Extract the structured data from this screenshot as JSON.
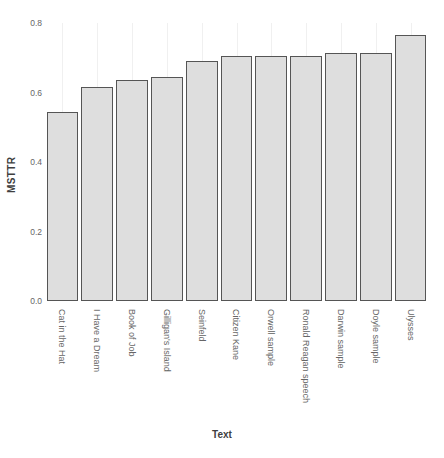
{
  "chart_data": {
    "type": "bar",
    "title": "",
    "xlabel": "Text",
    "ylabel": "MSTTR",
    "ylim": [
      0.0,
      0.8
    ],
    "yticks": [
      "0.0",
      "0.2",
      "0.4",
      "0.6",
      "0.8"
    ],
    "ytick_values": [
      0.0,
      0.2,
      0.4,
      0.6,
      0.8
    ],
    "grid": "vertical-only",
    "legend": "none",
    "categories": [
      "Cat in the Hat",
      "I Have a Dream",
      "Book of Job",
      "Gilligan's Island",
      "Seinfeld",
      "Citizen Kane",
      "Orwell sample",
      "Ronald Reagan speech",
      "Darwin sample",
      "Doyle sample",
      "Ulysses"
    ],
    "values": [
      0.545,
      0.615,
      0.635,
      0.645,
      0.69,
      0.705,
      0.705,
      0.705,
      0.715,
      0.715,
      0.765
    ],
    "bar_fill_color": "#dedede",
    "bar_border_color": "#555555",
    "grid_color": "#f0f0f0",
    "text_color": "#666666"
  }
}
